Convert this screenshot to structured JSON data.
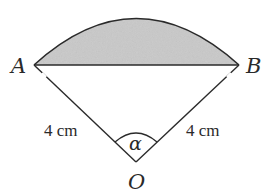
{
  "diagram": {
    "type": "circular-sector-segment",
    "points": {
      "A": {
        "label": "A",
        "x": 34,
        "y": 65
      },
      "B": {
        "label": "B",
        "x": 239,
        "y": 65
      },
      "O": {
        "label": "O",
        "x": 136,
        "y": 162
      }
    },
    "radius_labels": {
      "OA": "4 cm",
      "OB": "4 cm"
    },
    "angle_label": "α",
    "shaded_region": "segment between chord AB and arc AB",
    "colors": {
      "stroke": "#2a2a2a",
      "fill_shaded": "#c9c9c9",
      "background": "#ffffff"
    }
  }
}
